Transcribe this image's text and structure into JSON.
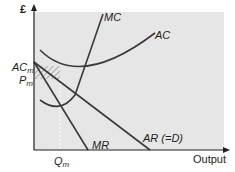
{
  "diagram": {
    "y_axis_label": "£",
    "x_axis_label": "Output",
    "curves": {
      "mc": "MC",
      "ac": "AC",
      "ar": "AR (=D)",
      "mr": "MR"
    },
    "levels": {
      "ac_m_main": "AC",
      "ac_m_sub": "m",
      "p_m_main": "P",
      "p_m_sub": "m",
      "q_m_main": "Q",
      "q_m_sub": "m"
    },
    "colors": {
      "panel": "#e6e6e6",
      "curve": "#3a3a3a",
      "hatch": "#b8b8b8"
    }
  }
}
